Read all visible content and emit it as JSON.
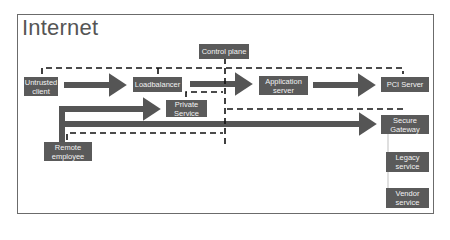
{
  "diagram": {
    "title": "Internet",
    "colors": {
      "node_fill": "#5a5a5a",
      "node_text": "#f2f2f2",
      "arrow": "#555555",
      "dashed": "#111111",
      "frame": "#6b6b6b"
    },
    "nodes": {
      "untrusted_client": "Untrusted client",
      "loadbalancer": "Loadbalancer",
      "control_plane": "Control plane",
      "application_server": "Application server",
      "pci_server": "PCI Server",
      "private_service": "Private Service",
      "remote_employee": "Remote employee",
      "secure_gateway": "Secure Gateway",
      "legacy_service": "Legacy service",
      "vendor_service": "Vendor service"
    },
    "edges": [
      {
        "from": "Untrusted client",
        "to": "Loadbalancer",
        "style": "solid-arrow"
      },
      {
        "from": "Loadbalancer",
        "to": "Application server",
        "style": "solid-arrow"
      },
      {
        "from": "Application server",
        "to": "PCI Server",
        "style": "solid-arrow"
      },
      {
        "from": "Remote employee",
        "to": "Private Service",
        "style": "solid-arrow"
      },
      {
        "from": "Remote employee",
        "to": "Secure Gateway",
        "style": "solid-arrow"
      },
      {
        "from": "Control plane",
        "to": "Untrusted client",
        "style": "dashed"
      },
      {
        "from": "Control plane",
        "to": "Loadbalancer",
        "style": "dashed"
      },
      {
        "from": "Control plane",
        "to": "PCI Server",
        "style": "dashed"
      },
      {
        "from": "Control plane",
        "to": "Private Service",
        "style": "dashed"
      },
      {
        "from": "Control plane",
        "to": "Remote employee",
        "style": "dashed"
      },
      {
        "from": "Control plane",
        "to": "Secure Gateway",
        "style": "dashed"
      },
      {
        "from": "Secure Gateway",
        "to": "Legacy service",
        "style": "thin-line"
      },
      {
        "from": "Secure Gateway",
        "to": "Vendor service",
        "style": "thin-line"
      }
    ]
  }
}
